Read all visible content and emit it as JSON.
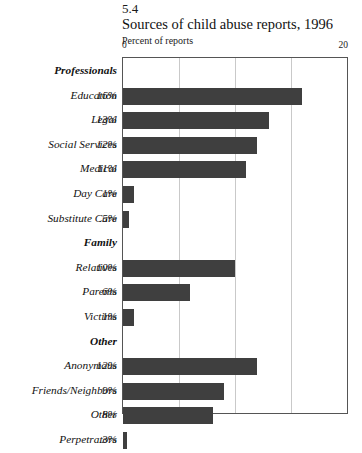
{
  "header": {
    "figure_number": "5.4",
    "title": "Sources of child abuse reports, 1996",
    "subtitle": "Percent of reports"
  },
  "axis": {
    "min_label": "0",
    "max_label": "20"
  },
  "chart_data": {
    "type": "bar",
    "orientation": "horizontal",
    "title": "Sources of child abuse reports, 1996",
    "figure_number": "5.4",
    "xlabel": "Percent of reports",
    "ylabel": "",
    "xlim": [
      0,
      20
    ],
    "xticks": [
      0,
      20
    ],
    "gridlines": [
      5,
      10,
      15
    ],
    "grid": true,
    "legend": "none",
    "bar_color": "#3f3f3f",
    "categories": [
      "Education",
      "Legal",
      "Social Services",
      "Medical",
      "Day Care",
      "Substitute Care",
      "Relatives",
      "Parents",
      "Victims",
      "Anonymous",
      "Friends/Neighbors",
      "Other",
      "Perpetrators"
    ],
    "values": [
      16,
      13,
      12,
      11,
      1,
      0.5,
      10,
      6,
      1,
      12,
      9,
      8,
      0.3
    ],
    "value_labels": [
      "16%",
      "13%",
      "12%",
      "11%",
      "1%",
      ".5%",
      "10%",
      "6%",
      "1%",
      "12%",
      "9%",
      "8%",
      ".3%"
    ],
    "groups": [
      {
        "name": "Professionals",
        "members": [
          "Education",
          "Legal",
          "Social Services",
          "Medical",
          "Day Care",
          "Substitute Care"
        ]
      },
      {
        "name": "Family",
        "members": [
          "Relatives",
          "Parents",
          "Victims"
        ]
      },
      {
        "name": "Other",
        "members": [
          "Anonymous",
          "Friends/Neighbors",
          "Other",
          "Perpetrators"
        ]
      }
    ]
  },
  "rows": [
    {
      "type": "group",
      "label": "Professionals",
      "value": "",
      "num": null
    },
    {
      "type": "bar",
      "label": "Education",
      "value": "16%",
      "num": 16
    },
    {
      "type": "bar",
      "label": "Legal",
      "value": "13%",
      "num": 13
    },
    {
      "type": "bar",
      "label": "Social Services",
      "value": "12%",
      "num": 12
    },
    {
      "type": "bar",
      "label": "Medical",
      "value": "11%",
      "num": 11
    },
    {
      "type": "bar",
      "label": "Day Care",
      "value": "1%",
      "num": 1
    },
    {
      "type": "bar",
      "label": "Substitute Care",
      "value": ".5%",
      "num": 0.5
    },
    {
      "type": "group",
      "label": "Family",
      "value": "",
      "num": null
    },
    {
      "type": "bar",
      "label": "Relatives",
      "value": "10%",
      "num": 10
    },
    {
      "type": "bar",
      "label": "Parents",
      "value": "6%",
      "num": 6
    },
    {
      "type": "bar",
      "label": "Victims",
      "value": "1%",
      "num": 1
    },
    {
      "type": "group",
      "label": "Other",
      "value": "",
      "num": null
    },
    {
      "type": "bar",
      "label": "Anonymous",
      "value": "12%",
      "num": 12
    },
    {
      "type": "bar",
      "label": "Friends/Neighbors",
      "value": "9%",
      "num": 9
    },
    {
      "type": "bar",
      "label": "Other",
      "value": "8%",
      "num": 8
    },
    {
      "type": "bar",
      "label": "Perpetrators",
      "value": ".3%",
      "num": 0.3
    }
  ]
}
